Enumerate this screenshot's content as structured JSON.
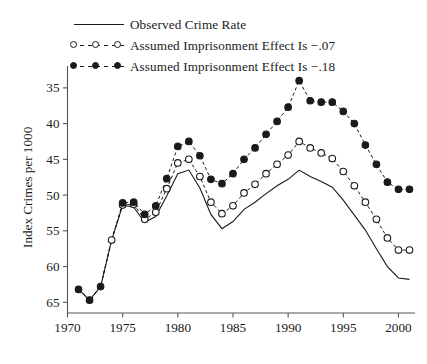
{
  "chart_data": {
    "type": "line",
    "title": "",
    "xlabel": "",
    "ylabel": "Index Crimes per 1000",
    "xlim": [
      1970,
      2001.5
    ],
    "ylim": [
      33.5,
      67.5
    ],
    "xticks": [
      1970,
      1975,
      1980,
      1985,
      1990,
      1995,
      2000
    ],
    "yticks": [
      35,
      40,
      45,
      50,
      55,
      60,
      65
    ],
    "grid": false,
    "legend_position": "top-left-above-axes",
    "x": [
      1971,
      1972,
      1973,
      1974,
      1975,
      1976,
      1977,
      1978,
      1979,
      1980,
      1981,
      1982,
      1983,
      1984,
      1985,
      1986,
      1987,
      1988,
      1989,
      1990,
      1991,
      1992,
      1993,
      1994,
      1995,
      1996,
      1997,
      1998,
      1999,
      2000,
      2001
    ],
    "series": [
      {
        "name": "Observed Crime Rate",
        "marker": "none",
        "linestyle": "solid",
        "values": [
          36.8,
          35.3,
          37.2,
          43.7,
          48.6,
          48.3,
          46.2,
          47.0,
          49.9,
          53.0,
          53.5,
          51.0,
          47.3,
          45.3,
          46.3,
          48.0,
          49.0,
          50.2,
          51.3,
          52.2,
          53.5,
          52.6,
          51.9,
          51.1,
          49.3,
          47.2,
          45.1,
          42.5,
          40.0,
          38.4,
          38.2
        ]
      },
      {
        "name": "Assumed Imprisonment Effect Is −.07",
        "marker": "open-circle",
        "linestyle": "dashed",
        "values": [
          36.8,
          35.3,
          37.2,
          43.7,
          48.6,
          48.7,
          46.6,
          47.6,
          50.9,
          54.5,
          55.0,
          52.6,
          49.0,
          47.4,
          48.5,
          50.3,
          51.5,
          53.0,
          54.3,
          55.6,
          57.5,
          56.6,
          55.9,
          55.1,
          53.3,
          51.3,
          49.0,
          46.6,
          44.0,
          42.3,
          42.3
        ]
      },
      {
        "name": "Assumed Imprisonment Effect Is −.18",
        "marker": "filled-circle",
        "linestyle": "dashed",
        "values": [
          36.8,
          35.3,
          37.2,
          43.7,
          48.9,
          49.0,
          47.3,
          48.5,
          52.3,
          56.8,
          57.5,
          55.5,
          52.2,
          51.6,
          53.0,
          55.0,
          56.6,
          58.5,
          60.3,
          62.3,
          66.0,
          63.2,
          63.0,
          63.0,
          61.7,
          60.0,
          57.0,
          54.3,
          51.8,
          50.8,
          50.8
        ]
      }
    ]
  },
  "legend": {
    "items": [
      {
        "label": "Observed Crime Rate",
        "key": "solid-line"
      },
      {
        "label": "Assumed Imprisonment Effect Is −.07",
        "key": "open-circle-dashed"
      },
      {
        "label": "Assumed Imprisonment Effect Is −.18",
        "key": "filled-circle-dashed"
      }
    ]
  },
  "axes": {
    "y_title": "Index Crimes per 1000",
    "y_tick_labels": [
      "65",
      "60",
      "55",
      "50",
      "45",
      "40",
      "35"
    ],
    "x_tick_labels": [
      "1970",
      "1975",
      "1980",
      "1985",
      "1990",
      "1995",
      "2000"
    ]
  }
}
